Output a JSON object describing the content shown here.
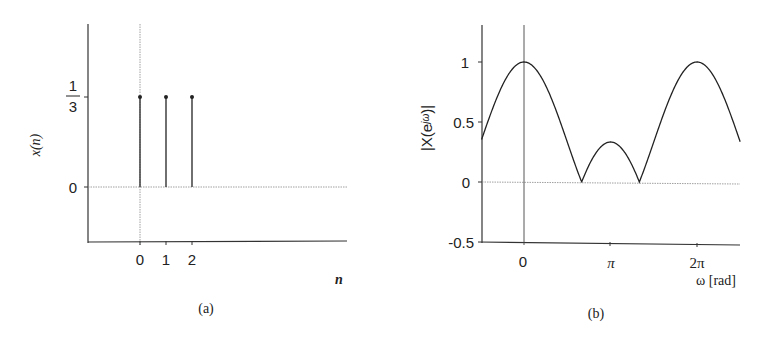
{
  "chart_data": [
    {
      "id": "a",
      "type": "stem",
      "caption": "(a)",
      "title": "",
      "xlabel": "n",
      "ylabel": "x(n)",
      "x": [
        0,
        1,
        2
      ],
      "values": [
        0.3333,
        0.3333,
        0.3333
      ],
      "xticks": [
        "0",
        "1",
        "2"
      ],
      "yticks": [
        {
          "value": 0,
          "label": "0"
        },
        {
          "value": 0.3333,
          "label_num": "1",
          "label_den": "3"
        }
      ],
      "xlim": [
        -2,
        8
      ],
      "ylim": [
        -0.2,
        0.55
      ],
      "grid": false
    },
    {
      "id": "b",
      "type": "line",
      "caption": "(b)",
      "title": "",
      "xlabel": "ω [rad]",
      "ylabel": "|X(e^jω)|",
      "function": "|sin(3ω/2) / (3 sin(ω/2))|",
      "x_samples_rad": [
        -1.54,
        0,
        1.0472,
        2.0944,
        3.1416,
        4.1888,
        5.236,
        6.2832,
        7.85
      ],
      "values": [
        0.33,
        1.0,
        0.6667,
        0.0,
        0.3333,
        0.0,
        0.6667,
        1.0,
        0.33
      ],
      "xticks": [
        {
          "value": 0,
          "label": "0"
        },
        {
          "value": 3.1416,
          "label": "π"
        },
        {
          "value": 6.2832,
          "label": "2π"
        }
      ],
      "yticks": [
        {
          "value": 1,
          "label": "1"
        },
        {
          "value": 0.5,
          "label": "0.5"
        },
        {
          "value": 0,
          "label": "0"
        },
        {
          "value": -0.5,
          "label": "-0.5"
        }
      ],
      "xlim": [
        -1.54,
        7.85
      ],
      "ylim": [
        -0.5,
        1.3
      ],
      "grid": false
    }
  ],
  "labels": {
    "a": {
      "ylabel": "x(n)",
      "xlabel": "n",
      "caption": "(a)",
      "tick0": "0",
      "tick1": "1",
      "tick2": "2",
      "y0": "0",
      "y_num": "1",
      "y_den": "3"
    },
    "b": {
      "ylabel": "|X(e",
      "ylabel_sup": "jω",
      "ylabel_end": ")|",
      "xlabel": "ω [rad]",
      "caption": "(b)",
      "x0": "0",
      "xpi": "π",
      "x2pi": "2π",
      "y1": "1",
      "y05": "0.5",
      "y0": "0",
      "ym05": "-0.5"
    }
  },
  "colors": {
    "ink": "#222222",
    "dotted": "#888888"
  }
}
